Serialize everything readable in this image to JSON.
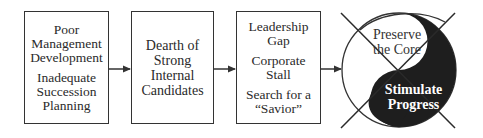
{
  "diagram": {
    "boxes": [
      {
        "id": "poor-management",
        "groups": [
          [
            "Poor",
            "Management",
            "Development"
          ],
          [
            "Inadequate",
            "Succession",
            "Planning"
          ]
        ]
      },
      {
        "id": "dearth",
        "groups": [
          [
            "Dearth of",
            "Strong",
            "Internal",
            "Candidates"
          ]
        ]
      },
      {
        "id": "leadership-gap",
        "groups": [
          [
            "Leadership",
            "Gap"
          ],
          [
            "Corporate",
            "Stall"
          ],
          [
            "Search for a",
            "“Savior”"
          ]
        ]
      }
    ],
    "yin_yang": {
      "top_label": [
        "Preserve",
        "the Core"
      ],
      "bottom_label": [
        "Stimulate",
        "Progress"
      ],
      "crossed_out": true
    },
    "arrows": [
      "box1-to-box2",
      "box2-to-box3",
      "box3-to-yinyang"
    ],
    "colors": {
      "stroke": "#333333",
      "fill_dark": "#1e1e1e",
      "background": "#ffffff"
    }
  }
}
